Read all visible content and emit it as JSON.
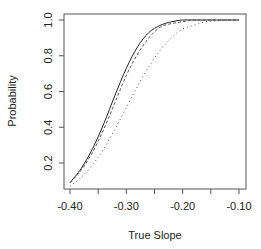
{
  "chart_data": {
    "type": "line",
    "title": "",
    "xlabel": "True Slope",
    "ylabel": "Probability",
    "xlim": [
      -0.41,
      -0.087
    ],
    "ylim": [
      0.05,
      1.03
    ],
    "x_ticks": [
      -0.4,
      -0.35,
      -0.3,
      -0.25,
      -0.2,
      -0.15,
      -0.1
    ],
    "x_tick_labels": [
      "-0.40",
      "",
      "-0.30",
      "",
      "-0.20",
      "",
      "-0.10"
    ],
    "y_ticks": [
      0.2,
      0.4,
      0.6,
      0.8,
      1.0
    ],
    "y_tick_labels": [
      "0.2",
      "0.4",
      "0.6",
      "0.8",
      "1.0"
    ],
    "grid": false,
    "legend": null,
    "x": [
      -0.4,
      -0.38,
      -0.36,
      -0.34,
      -0.32,
      -0.3,
      -0.28,
      -0.26,
      -0.24,
      -0.22,
      -0.2,
      -0.18,
      -0.16,
      -0.14,
      -0.12,
      -0.1
    ],
    "series": [
      {
        "name": "solid",
        "style": "solid",
        "values": [
          0.09,
          0.17,
          0.28,
          0.42,
          0.58,
          0.73,
          0.85,
          0.93,
          0.97,
          0.99,
          1.0,
          1.0,
          1.0,
          1.0,
          1.0,
          1.0
        ]
      },
      {
        "name": "dashed",
        "style": "dashed",
        "values": [
          0.09,
          0.16,
          0.26,
          0.39,
          0.54,
          0.69,
          0.81,
          0.9,
          0.96,
          0.98,
          0.99,
          1.0,
          1.0,
          1.0,
          1.0,
          1.0
        ]
      },
      {
        "name": "dotted",
        "style": "dotted",
        "values": [
          0.07,
          0.12,
          0.19,
          0.28,
          0.39,
          0.51,
          0.63,
          0.74,
          0.83,
          0.9,
          0.95,
          0.97,
          0.99,
          0.995,
          1.0,
          1.0
        ]
      }
    ],
    "plot_box_px": {
      "left": 64,
      "top": 14,
      "right": 246,
      "bottom": 189
    }
  }
}
